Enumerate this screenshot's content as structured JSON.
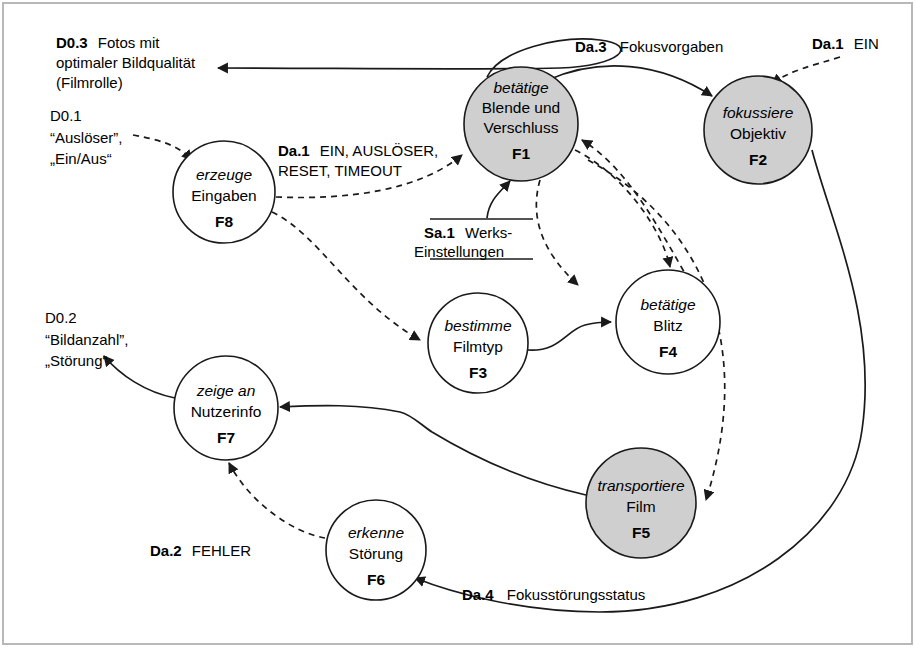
{
  "diagram": {
    "type": "data-flow-diagram",
    "colors": {
      "node_fill_highlight": "#cfcfcf",
      "node_fill_plain": "#ffffff",
      "stroke": "#1a1a1a",
      "background": "#ffffff"
    },
    "processes": [
      {
        "id": "F1",
        "verb": "betätige",
        "noun_lines": [
          "Blende und",
          "Verschluss"
        ],
        "shaded": true,
        "cx": 521,
        "cy": 124,
        "r": 57
      },
      {
        "id": "F2",
        "verb": "fokussiere",
        "noun_lines": [
          "Objektiv"
        ],
        "shaded": true,
        "cx": 758,
        "cy": 130,
        "r": 54
      },
      {
        "id": "F3",
        "verb": "bestimme",
        "noun_lines": [
          "Filmtyp"
        ],
        "shaded": false,
        "cx": 478,
        "cy": 343,
        "r": 50
      },
      {
        "id": "F4",
        "verb": "betätige",
        "noun_lines": [
          "Blitz"
        ],
        "shaded": false,
        "cx": 668,
        "cy": 322,
        "r": 52
      },
      {
        "id": "F5",
        "verb": "transportiere",
        "noun_lines": [
          "Film"
        ],
        "shaded": true,
        "cx": 641,
        "cy": 503,
        "r": 55
      },
      {
        "id": "F6",
        "verb": "erkenne",
        "noun_lines": [
          "Störung"
        ],
        "shaded": false,
        "cx": 376,
        "cy": 550,
        "r": 50
      },
      {
        "id": "F7",
        "verb": "zeige an",
        "noun_lines": [
          "Nutzerinfo"
        ],
        "shaded": false,
        "cx": 226,
        "cy": 408,
        "r": 52
      },
      {
        "id": "F8",
        "verb": "erzeuge",
        "noun_lines": [
          "Eingaben"
        ],
        "shaded": false,
        "cx": 224,
        "cy": 192,
        "r": 51
      }
    ],
    "store": {
      "id": "Sa.1",
      "label_line1": "Werks-",
      "label_line2": "Einstellungen"
    },
    "terminators": [
      {
        "id": "D0.3",
        "lines": [
          "Fotos mit",
          "optimaler Bildqualität",
          "(Filmrolle)"
        ],
        "italic": false
      },
      {
        "id": "D0.1",
        "lines": [
          "“Auslöser”,",
          "„Ein/Aus“"
        ],
        "italic": true
      },
      {
        "id": "D0.2",
        "lines": [
          "“Bildanzahl”,",
          "„Störung“"
        ],
        "italic": true
      }
    ],
    "flows": [
      {
        "id": "Da.1",
        "text": "EIN, AUSLÖSER,",
        "text2": "RESET, TIMEOUT",
        "kind": "control"
      },
      {
        "id": "Da.3",
        "text": "Fokusvorgaben",
        "kind": "control"
      },
      {
        "id": "Da.1",
        "text": "EIN",
        "kind": "control"
      },
      {
        "id": "Da.2",
        "text": "FEHLER",
        "kind": "control"
      },
      {
        "id": "Da.4",
        "text": "Fokusstörungsstatus",
        "kind": "data"
      }
    ],
    "labels": {
      "d03_id": "D0.3",
      "d03_l1": "Fotos mit",
      "d03_l2": "optimaler Bildqualität",
      "d03_l3": "(Filmrolle)",
      "d01_id": "D0.1",
      "d01_l1": "“Auslöser”,",
      "d01_l2": "„Ein/Aus“",
      "d02_id": "D0.2",
      "d02_l1": "“Bildanzahl”,",
      "d02_l2": "„Störung“",
      "da1_left_id": "Da.1",
      "da1_left_l1": "EIN, AUSLÖSER,",
      "da1_left_l2": "RESET, TIMEOUT",
      "da3_id": "Da.3",
      "da3_text": "Fokusvorgaben",
      "da1_right_id": "Da.1",
      "da1_right_text": "EIN",
      "sa1_id": "Sa.1",
      "sa1_l1": "Werks-",
      "sa1_l2": "Einstellungen",
      "da2_id": "Da.2",
      "da2_text": "FEHLER",
      "da4_id": "Da.4",
      "da4_text": "Fokusstörungsstatus"
    }
  }
}
